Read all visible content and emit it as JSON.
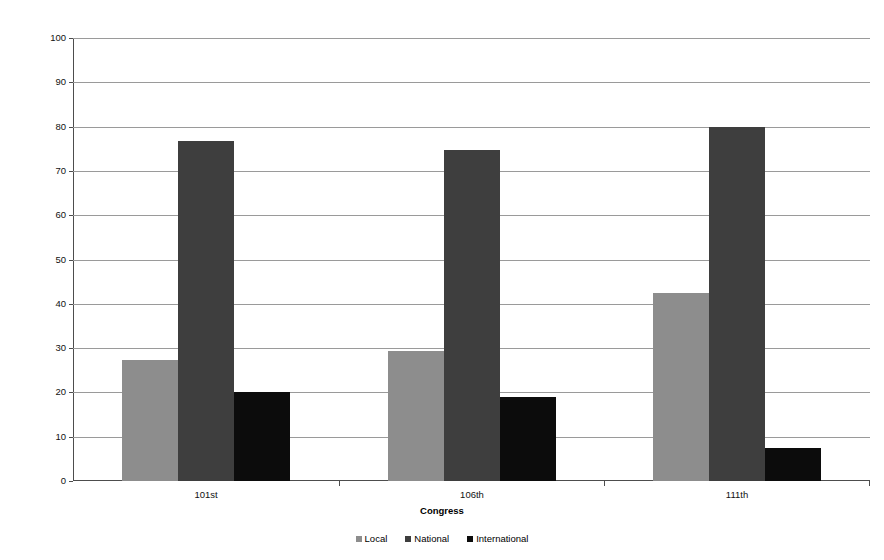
{
  "chart_data": {
    "type": "bar",
    "title": "",
    "subtitle": "",
    "xlabel": "Congress",
    "ylabel": "Percentage of Speeches",
    "categories": [
      "101st",
      "106th",
      "111th"
    ],
    "series": [
      {
        "name": "Local",
        "color": "#8d8d8d",
        "values": [
          27.3,
          29.3,
          42.5
        ]
      },
      {
        "name": "National",
        "color": "#3e3e3e",
        "values": [
          76.8,
          74.8,
          80.0
        ]
      },
      {
        "name": "International",
        "color": "#0c0c0c",
        "values": [
          20.0,
          19.0,
          7.4
        ]
      }
    ],
    "ylim": [
      0,
      100
    ],
    "ytick_labels": [
      "0",
      "10",
      "20",
      "30",
      "40",
      "50",
      "60",
      "70",
      "80",
      "90",
      "100"
    ],
    "ytick_values": [
      0,
      10,
      20,
      30,
      40,
      50,
      60,
      70,
      80,
      90,
      100
    ],
    "grid": true,
    "grid_axis": "y",
    "legend_position": "bottom",
    "legend_marker": "square",
    "background_color": "#ffffff",
    "axis_color": "#4d4d4d",
    "grid_color": "#9a9a9a"
  }
}
